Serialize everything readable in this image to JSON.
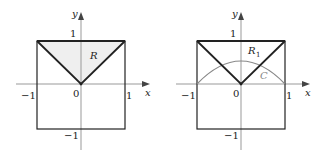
{
  "colors": {
    "axis": "#999999",
    "box": "#222222",
    "region_fill": "#efefef",
    "curve": "#888888"
  },
  "figures": [
    {
      "id": "left",
      "axis_labels": {
        "x": "x",
        "y": "y"
      },
      "tick_labels": {
        "x_neg": "−1",
        "origin": "0",
        "x_pos": "1",
        "y_pos": "1",
        "y_neg": "−1"
      },
      "region_label": "R",
      "shaded": true
    },
    {
      "id": "right",
      "axis_labels": {
        "x": "x",
        "y": "y"
      },
      "tick_labels": {
        "x_neg": "−1",
        "origin": "0",
        "x_pos": "1",
        "y_pos": "1",
        "y_neg": "−1"
      },
      "region_label": "R",
      "region_subscript": "1",
      "curve_label": "C",
      "shaded": false
    }
  ]
}
